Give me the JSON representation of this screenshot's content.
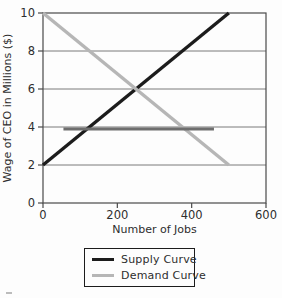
{
  "chart_data": {
    "type": "line",
    "title": "",
    "xlabel": "Number of Jobs",
    "ylabel": "Wage of CEO in Millions ($)",
    "xlim": [
      0,
      600
    ],
    "ylim": [
      0,
      10
    ],
    "x_ticks": [
      0,
      200,
      400,
      600
    ],
    "y_ticks": [
      0,
      2,
      4,
      6,
      8,
      10
    ],
    "grid": "horizontal-gridlines-on",
    "legend_position": "bottom-center-boxed",
    "intersection_point": [
      250,
      6
    ],
    "series": [
      {
        "name": "Supply Curve",
        "color": "#1c1c1c",
        "width": 3.4,
        "in_legend": true,
        "points": [
          [
            0,
            2
          ],
          [
            500,
            10
          ]
        ]
      },
      {
        "name": "Demand Curve",
        "color": "#b6b6b6",
        "width": 3.4,
        "in_legend": true,
        "points": [
          [
            0,
            10
          ],
          [
            500,
            2
          ]
        ]
      },
      {
        "name": "horizontal-wage-line",
        "color": "#6e6e6e",
        "width": 3,
        "in_legend": false,
        "points": [
          [
            55,
            3.9
          ],
          [
            460,
            3.9
          ]
        ]
      }
    ],
    "axis_color": "#4a4a4a",
    "gridline_color": "#7a7a7a",
    "text_color": "#2e2e2e"
  }
}
